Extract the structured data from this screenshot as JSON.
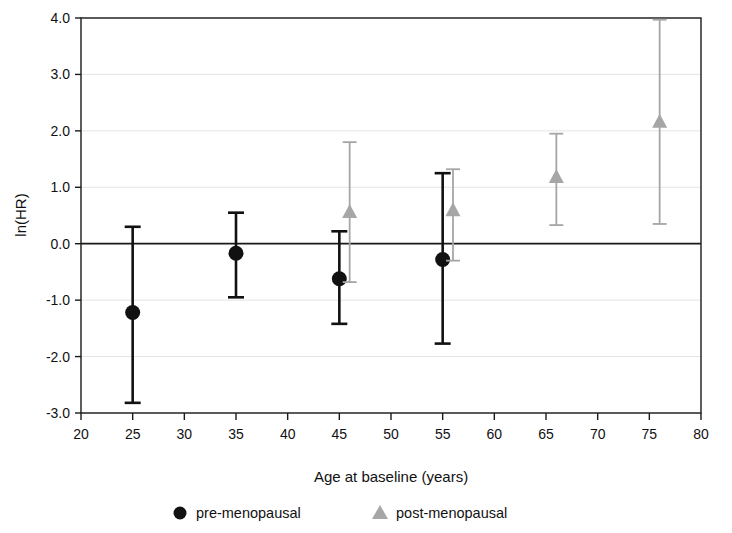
{
  "chart_data": {
    "type": "scatter",
    "title": "",
    "xlabel": "Age at baseline (years)",
    "ylabel": "ln(HR)",
    "xlim": [
      20,
      80
    ],
    "ylim": [
      -3.0,
      4.0
    ],
    "xticks": [
      20,
      25,
      30,
      35,
      40,
      45,
      50,
      55,
      60,
      65,
      70,
      75,
      80
    ],
    "xtick_labels": [
      "20",
      "25",
      "30",
      "35",
      "40",
      "45",
      "50",
      "55",
      "60",
      "65",
      "70",
      "75",
      "80"
    ],
    "yticks": [
      4.0,
      3.0,
      2.0,
      1.0,
      0.0,
      -1.0,
      -2.0,
      -3.0
    ],
    "ytick_labels": [
      "4.0",
      "3.0",
      "2.0",
      "1.0",
      "0.0",
      "-1.0",
      "-2.0",
      "-3.0"
    ],
    "grid": true,
    "reference_line": {
      "y": 0.0,
      "color": "#1a1a1a"
    },
    "legend_position": "below",
    "series": [
      {
        "name": "pre-menopausal",
        "marker": "circle",
        "color": "#111111",
        "points": [
          {
            "x": 25,
            "y": -1.22,
            "lower": -2.82,
            "upper": 0.3
          },
          {
            "x": 35,
            "y": -0.17,
            "lower": -0.95,
            "upper": 0.55
          },
          {
            "x": 45,
            "y": -0.62,
            "lower": -1.42,
            "upper": 0.22
          },
          {
            "x": 55,
            "y": -0.28,
            "lower": -1.77,
            "upper": 1.25
          }
        ]
      },
      {
        "name": "post-menopausal",
        "marker": "triangle",
        "color": "#a6a6a6",
        "points": [
          {
            "x": 46,
            "y": 0.55,
            "lower": -0.68,
            "upper": 1.8
          },
          {
            "x": 56,
            "y": 0.58,
            "lower": -0.3,
            "upper": 1.32
          },
          {
            "x": 66,
            "y": 1.17,
            "lower": 0.33,
            "upper": 1.95
          },
          {
            "x": 76,
            "y": 2.15,
            "lower": 0.35,
            "upper": 3.97
          }
        ]
      }
    ]
  },
  "legend": {
    "entries": [
      {
        "label": "pre-menopausal",
        "marker": "circle",
        "color": "#111111"
      },
      {
        "label": "post-menopausal",
        "marker": "triangle",
        "color": "#a6a6a6"
      }
    ]
  }
}
